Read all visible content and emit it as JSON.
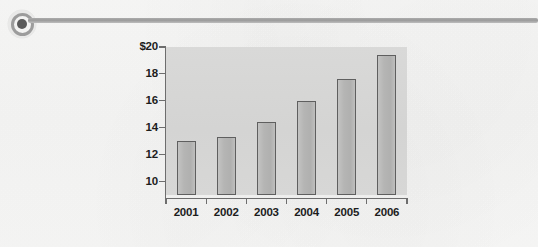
{
  "page": {
    "background_color": "#f7f7f6",
    "divider": {
      "marker_icon": "bullet-circle-icon",
      "line_color": "#9a9a9a"
    }
  },
  "chart_data": {
    "type": "bar",
    "title": "",
    "subtitle": "",
    "xlabel": "",
    "ylabel": "",
    "categories": [
      "2001",
      "2002",
      "2003",
      "2004",
      "2005",
      "2006"
    ],
    "values": [
      13.0,
      13.3,
      14.4,
      16.0,
      17.6,
      19.4
    ],
    "ylim": [
      9.0,
      20.0
    ],
    "y_ticks": [
      10,
      12,
      14,
      16,
      18,
      20
    ],
    "y_tick_labels": [
      "10",
      "12",
      "14",
      "16",
      "18",
      "$20"
    ],
    "grid": false,
    "legend": false,
    "legend_position": "none",
    "series": [
      {
        "name": "value",
        "values": [
          13.0,
          13.3,
          14.4,
          16.0,
          17.6,
          19.4
        ]
      }
    ],
    "colors": {
      "bar_fill": "#b5b5b4",
      "bar_border": "#5f5f5f",
      "plot_background": "#d5d5d4",
      "axis": "#6d6d6d",
      "text": "#1d1d1d"
    }
  }
}
